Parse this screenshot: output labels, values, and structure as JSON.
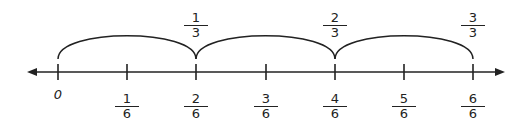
{
  "number_line": {
    "axis_color": "#222222",
    "ticks": [
      {
        "x": 58,
        "label_whole": "0"
      },
      {
        "x": 127,
        "num": "1",
        "den": "6"
      },
      {
        "x": 196,
        "num": "2",
        "den": "6"
      },
      {
        "x": 266,
        "num": "3",
        "den": "6"
      },
      {
        "x": 335,
        "num": "4",
        "den": "6"
      },
      {
        "x": 404,
        "num": "5",
        "den": "6"
      },
      {
        "x": 473,
        "num": "6",
        "den": "6"
      }
    ],
    "top_labels": [
      {
        "x": 196,
        "num": "1",
        "den": "3"
      },
      {
        "x": 335,
        "num": "2",
        "den": "3"
      },
      {
        "x": 473,
        "num": "3",
        "den": "3"
      }
    ]
  }
}
